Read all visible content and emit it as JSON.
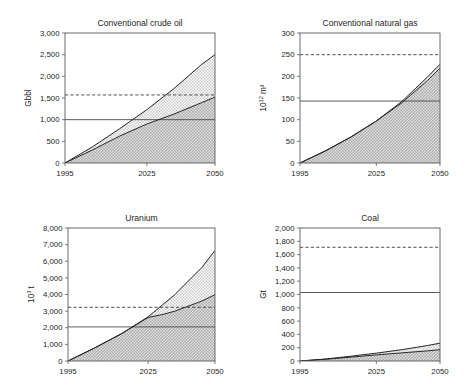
{
  "figure": {
    "background": "#ffffff",
    "panel_count": 4,
    "colors": {
      "upper_band_fill": "#c9c9c9",
      "lower_band_fill": "#a8a8a8",
      "curve": "#262626",
      "frame": "#5c5c5c",
      "reference_solid": "#4a4a4a",
      "reference_dashed": "#3d3d3d"
    }
  },
  "chart_data": [
    {
      "id": "conventional-crude-oil",
      "type": "area",
      "title": "Conventional crude oil",
      "xlabel": "",
      "ylabel": "Gbbl",
      "ylabel_sup": "",
      "xlim": [
        1995,
        2050
      ],
      "ylim": [
        0,
        3000
      ],
      "xticks": [
        1995,
        2025,
        2050
      ],
      "xtick_labels": [
        "1995",
        "2025",
        "2050"
      ],
      "yticks": [
        0,
        500,
        1000,
        1500,
        2000,
        2500,
        3000
      ],
      "ytick_labels": [
        "0",
        "500",
        "1,000",
        "1,500",
        "2,000",
        "2,500",
        "3,000"
      ],
      "grid": false,
      "reference_lines": [
        {
          "name": "reserves",
          "style": "solid",
          "value": 1000
        },
        {
          "name": "resources",
          "style": "dashed",
          "value": 1570
        }
      ],
      "series": [
        {
          "name": "high-scenario-cumulative",
          "style": "upper-bound",
          "x": [
            1995,
            2005,
            2015,
            2025,
            2035,
            2045,
            2050
          ],
          "values": [
            0,
            370,
            790,
            1230,
            1720,
            2270,
            2500
          ]
        },
        {
          "name": "low-scenario-cumulative",
          "style": "lower-bound",
          "x": [
            1995,
            2005,
            2015,
            2025,
            2035,
            2045,
            2050
          ],
          "values": [
            0,
            300,
            620,
            900,
            1130,
            1390,
            1520
          ]
        }
      ]
    },
    {
      "id": "conventional-natural-gas",
      "type": "area",
      "title": "Conventional natural gas",
      "xlabel": "",
      "ylabel": "10",
      "ylabel_sup": "12",
      "ylabel_tail": " m³",
      "xlim": [
        1995,
        2050
      ],
      "ylim": [
        0,
        300
      ],
      "xticks": [
        1995,
        2025,
        2050
      ],
      "xtick_labels": [
        "1995",
        "2025",
        "2050"
      ],
      "yticks": [
        0,
        50,
        100,
        150,
        200,
        250,
        300
      ],
      "ytick_labels": [
        "0",
        "50",
        "100",
        "150",
        "200",
        "250",
        "300"
      ],
      "grid": false,
      "reference_lines": [
        {
          "name": "reserves",
          "style": "solid",
          "value": 143
        },
        {
          "name": "resources",
          "style": "dashed",
          "value": 250
        }
      ],
      "series": [
        {
          "name": "high-scenario-cumulative",
          "style": "upper-bound",
          "x": [
            1995,
            2005,
            2015,
            2025,
            2035,
            2045,
            2050
          ],
          "values": [
            0,
            28,
            60,
            97,
            142,
            198,
            228
          ]
        },
        {
          "name": "low-scenario-cumulative",
          "style": "lower-bound",
          "x": [
            1995,
            2005,
            2015,
            2025,
            2035,
            2045,
            2050
          ],
          "values": [
            0,
            28,
            60,
            97,
            139,
            190,
            219
          ]
        }
      ]
    },
    {
      "id": "uranium",
      "type": "area",
      "title": "Uranium",
      "xlabel": "",
      "ylabel": "10",
      "ylabel_sup": "3",
      "ylabel_tail": " t",
      "xlim": [
        1995,
        2050
      ],
      "ylim": [
        0,
        8000
      ],
      "xticks": [
        1995,
        2025,
        2050
      ],
      "xtick_labels": [
        "1995",
        "2025",
        "2050"
      ],
      "yticks": [
        0,
        1000,
        2000,
        3000,
        4000,
        5000,
        6000,
        7000,
        8000
      ],
      "ytick_labels": [
        "0",
        "1,000",
        "2,000",
        "3,000",
        "4,000",
        "5,000",
        "6,000",
        "7,000",
        "8,000"
      ],
      "grid": false,
      "reference_lines": [
        {
          "name": "reserves",
          "style": "solid",
          "value": 2050
        },
        {
          "name": "resources",
          "style": "dashed",
          "value": 3230
        }
      ],
      "series": [
        {
          "name": "high-scenario-cumulative",
          "style": "upper-bound",
          "x": [
            1995,
            2005,
            2015,
            2025,
            2035,
            2045,
            2050
          ],
          "values": [
            0,
            790,
            1640,
            2660,
            4000,
            5610,
            6650
          ]
        },
        {
          "name": "low-scenario-cumulative",
          "style": "lower-bound",
          "x": [
            1995,
            2005,
            2015,
            2025,
            2030,
            2035,
            2045,
            2050
          ],
          "values": [
            0,
            790,
            1640,
            2620,
            2780,
            3000,
            3600,
            3990
          ]
        }
      ]
    },
    {
      "id": "coal",
      "type": "area",
      "title": "Coal",
      "xlabel": "",
      "ylabel": "Gt",
      "ylabel_sup": "",
      "xlim": [
        1995,
        2050
      ],
      "ylim": [
        0,
        2000
      ],
      "xticks": [
        1995,
        2025,
        2050
      ],
      "xtick_labels": [
        "1995",
        "2025",
        "2050"
      ],
      "yticks": [
        0,
        200,
        400,
        600,
        800,
        1000,
        1200,
        1400,
        1600,
        1800,
        2000
      ],
      "ytick_labels": [
        "0",
        "200",
        "400",
        "600",
        "800",
        "1,000",
        "1,200",
        "1,400",
        "1,600",
        "1,800",
        "2,000"
      ],
      "grid": false,
      "reference_lines": [
        {
          "name": "reserves",
          "style": "solid",
          "value": 1030
        },
        {
          "name": "resources",
          "style": "dashed",
          "value": 1710
        }
      ],
      "series": [
        {
          "name": "high-scenario-cumulative",
          "style": "upper-bound",
          "x": [
            1995,
            2005,
            2015,
            2025,
            2035,
            2045,
            2050
          ],
          "values": [
            0,
            30,
            72,
            118,
            170,
            232,
            268
          ]
        },
        {
          "name": "low-scenario-cumulative",
          "style": "lower-bound",
          "x": [
            1995,
            2005,
            2015,
            2025,
            2035,
            2045,
            2050
          ],
          "values": [
            0,
            26,
            58,
            92,
            122,
            152,
            170
          ]
        }
      ]
    }
  ]
}
